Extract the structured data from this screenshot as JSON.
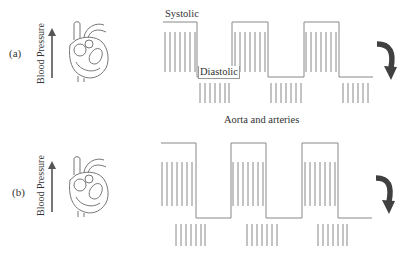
{
  "panels": [
    {
      "id": "a",
      "label": "(a)",
      "axis_label": "Blood Pressure",
      "systolic_label": "Systolic",
      "diastolic_label": "Diastolic",
      "arrow_direction": "curved-down-right"
    },
    {
      "id": "b",
      "label": "(b)",
      "axis_label": "Blood Pressure",
      "arrow_direction": "curved-down-right"
    }
  ],
  "caption": "Aorta and arteries",
  "colors": {
    "line": "#777777",
    "hatch": "#888888",
    "arrow": "#404040",
    "text": "#333333"
  }
}
